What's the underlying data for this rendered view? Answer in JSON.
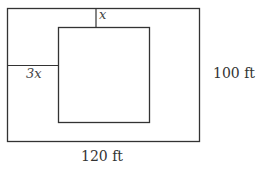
{
  "diagram": {
    "outer_rect": {
      "width_label": "120 ft",
      "height_label": "100 ft"
    },
    "inner_rect": {},
    "top_gap_label": "x",
    "left_gap_label": "3x"
  }
}
